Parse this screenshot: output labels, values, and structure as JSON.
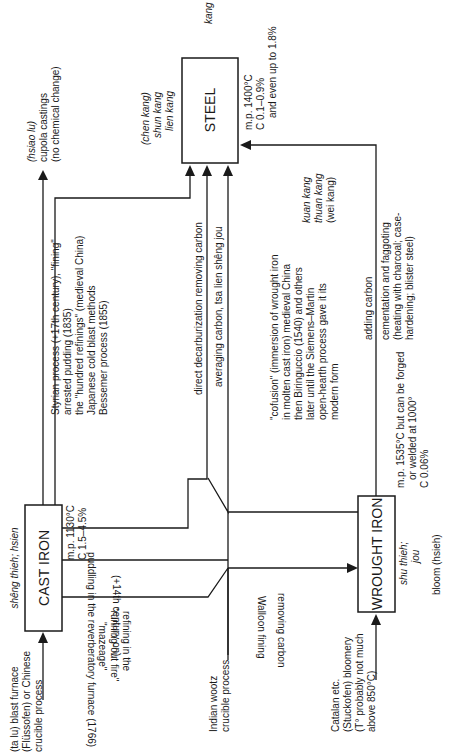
{
  "diagram": {
    "orientation": "rotated 90° counter-clockwise",
    "nodes": {
      "cast_iron": {
        "label": "CAST IRON",
        "chinese": "shêng thieh; hsien",
        "props": [
          "m.p. 1130°C",
          "C 1.5–4.5%"
        ]
      },
      "steel": {
        "label": "STEEL",
        "chinese_top": "kang",
        "chinese_left": [
          "(chen kang)",
          "shun kang",
          "lien kang"
        ],
        "chinese_right": [
          "kuan kang",
          "thuan kang",
          "(wei kang)"
        ],
        "props": [
          "m.p. 1400°C",
          "C 0.1–0.9%",
          "and even up to 1.8%"
        ]
      },
      "wrought_iron": {
        "label": "WROUGHT IRON",
        "chinese": [
          "shu thieh;",
          "jou"
        ],
        "props": [
          "m.p. 1535°C but can be forged",
          "or welded at 1000°",
          "C 0.06%"
        ],
        "bloom": "bloom (hsieh)"
      }
    },
    "inputs": {
      "blast_furnace": [
        "(ta lu) blast furnace",
        "(Flüssofen) or Chinese",
        "crucible process"
      ],
      "indian_wootz": [
        "Indian wootz",
        "crucible process"
      ],
      "bloomery": [
        "Catalan etc.",
        "(Stuckofen) bloomery",
        "(T° probably not much",
        "above 850°C)"
      ]
    },
    "outputs": {
      "cupola": [
        "(hsiao lu)",
        "cupola castings",
        "(no chemical change)"
      ]
    },
    "processes": {
      "fining": [
        "Styrian process (+17th century), \"fining\"",
        "arrested pudding (1835)",
        "the \"hundred refinings\" (medieval China)",
        "Japanese cold blast methods",
        "Bessemer process (1855)"
      ],
      "direct_decarb": "direct decarburization removing carbon",
      "averaging_carbon": "averaging carbon, tsa lien shêng jou",
      "cofusion": [
        "\"cofusion\" (immersion of wrought iron",
        "in molten cast iron) medieval China",
        "then Biringuccio (1540) and others",
        "later until the Siemens–Martin",
        "open-hearth process gave it its",
        "modern form"
      ],
      "adding_carbon": "adding carbon",
      "cementation": [
        "cementation and faggoting",
        "(heating with charcoal; case-",
        "hardening; blister steel)"
      ],
      "puddling": "puddling in the reverberatory furnace (1766)",
      "fourteenth_century": "(+14th century on)",
      "walloon": "Walloon fining",
      "removing_carbon": "removing carbon",
      "running_out_fire": [
        "refining in the",
        "\"running-out fire\"",
        "\"mazeage\""
      ]
    }
  }
}
